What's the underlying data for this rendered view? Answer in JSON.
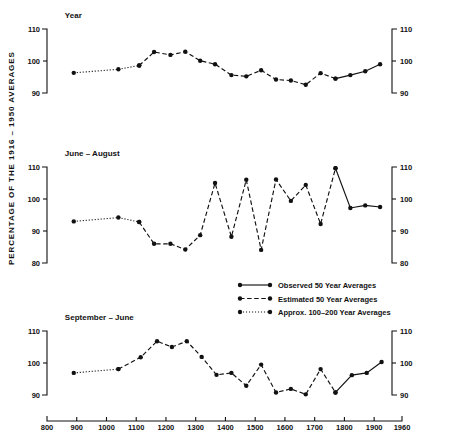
{
  "figure": {
    "ylabel": "PERCENTAGE  OF  THE  1916 – 1950  AVERAGES",
    "x_axis": {
      "min": 800,
      "max": 1960,
      "ticks": [
        800,
        900,
        1000,
        1100,
        1200,
        1300,
        1400,
        1500,
        1600,
        1700,
        1800,
        1900,
        1960
      ],
      "tick_labels": [
        "800",
        "900",
        "1000",
        "1100",
        "1200",
        "1300",
        "1400",
        "1500",
        "1600",
        "1700",
        "1800",
        "1900",
        "1960"
      ]
    },
    "legend": {
      "title": "",
      "items": [
        {
          "label": "Observed  50  Year  Averages",
          "style": "solid",
          "marker": "filled-circle"
        },
        {
          "label": "Estimated  50  Year  Averages",
          "style": "dashed",
          "marker": "filled-circle"
        },
        {
          "label": "Approx.  100–200  Year  Averages",
          "style": "dotted",
          "marker": "filled-circle"
        }
      ]
    }
  },
  "chart_data": [
    {
      "type": "line",
      "title": "Year",
      "xlabel": "",
      "ylabel": "PERCENTAGE OF THE 1916-1950 AVERAGES",
      "xlim": [
        800,
        1960
      ],
      "ylim": [
        90,
        110
      ],
      "yticks": [
        90,
        100,
        110
      ],
      "ytick_labels": [
        "90",
        "100",
        "110"
      ],
      "grid": false,
      "series": [
        {
          "name": "Approx. 100-200 Year Averages",
          "style": "dotted",
          "x": [
            890,
            1040,
            1110
          ],
          "values": [
            96.3,
            97.4,
            98.6
          ]
        },
        {
          "name": "Estimated 50 Year Averages",
          "style": "dashed",
          "x": [
            1110,
            1160,
            1215,
            1265,
            1315,
            1365,
            1420,
            1470,
            1520,
            1570,
            1620,
            1670,
            1720,
            1770
          ],
          "values": [
            98.6,
            102.8,
            101.9,
            102.9,
            100.1,
            99.0,
            95.6,
            95.2,
            97.1,
            94.2,
            93.9,
            92.6,
            96.2,
            94.5
          ]
        },
        {
          "name": "Observed 50 Year Averages",
          "style": "solid",
          "x": [
            1770,
            1820,
            1870,
            1920
          ],
          "values": [
            94.5,
            95.6,
            96.8,
            99.0
          ]
        }
      ]
    },
    {
      "type": "line",
      "title": "June – August",
      "xlabel": "",
      "ylabel": "PERCENTAGE OF THE 1916-1950 AVERAGES",
      "xlim": [
        800,
        1960
      ],
      "ylim": [
        80,
        110
      ],
      "yticks": [
        80,
        90,
        100,
        110
      ],
      "ytick_labels": [
        "80",
        "90",
        "100",
        "110"
      ],
      "grid": false,
      "series": [
        {
          "name": "Approx. 100-200 Year Averages",
          "style": "dotted",
          "x": [
            890,
            1040,
            1110
          ],
          "values": [
            93.0,
            94.2,
            92.8
          ]
        },
        {
          "name": "Estimated 50 Year Averages",
          "style": "dashed",
          "x": [
            1110,
            1160,
            1215,
            1265,
            1315,
            1365,
            1420,
            1470,
            1520,
            1570,
            1620,
            1670,
            1720,
            1770
          ],
          "values": [
            92.8,
            86.0,
            86.0,
            84.2,
            88.7,
            105.0,
            88.2,
            106.0,
            84.1,
            106.1,
            99.4,
            104.4,
            92.2,
            109.6
          ]
        },
        {
          "name": "Observed 50 Year Averages",
          "style": "solid",
          "x": [
            1770,
            1820,
            1870,
            1920
          ],
          "values": [
            109.6,
            97.2,
            98.0,
            97.5
          ]
        }
      ]
    },
    {
      "type": "line",
      "title": "September – June",
      "xlabel": "",
      "ylabel": "PERCENTAGE OF THE 1916-1950 AVERAGES",
      "xlim": [
        800,
        1960
      ],
      "ylim": [
        88,
        110
      ],
      "yticks": [
        90,
        100,
        110
      ],
      "ytick_labels": [
        "90",
        "100",
        "110"
      ],
      "grid": false,
      "series": [
        {
          "name": "Approx. 100-200 Year Averages",
          "style": "dotted",
          "x": [
            890,
            1040
          ],
          "values": [
            96.9,
            98.1
          ]
        },
        {
          "name": "Estimated 50 Year Averages",
          "style": "dashed",
          "x": [
            1040,
            1115,
            1170,
            1220,
            1270,
            1320,
            1370,
            1420,
            1470,
            1520,
            1570,
            1620,
            1670,
            1720,
            1770
          ],
          "values": [
            98.1,
            101.8,
            106.8,
            105.0,
            106.8,
            101.9,
            96.3,
            96.9,
            92.9,
            99.5,
            90.8,
            91.9,
            90.2,
            98.1,
            90.8
          ]
        },
        {
          "name": "Observed 50 Year Averages",
          "style": "solid",
          "x": [
            1770,
            1825,
            1875,
            1925
          ],
          "values": [
            90.8,
            96.2,
            96.9,
            100.3
          ]
        }
      ]
    }
  ]
}
